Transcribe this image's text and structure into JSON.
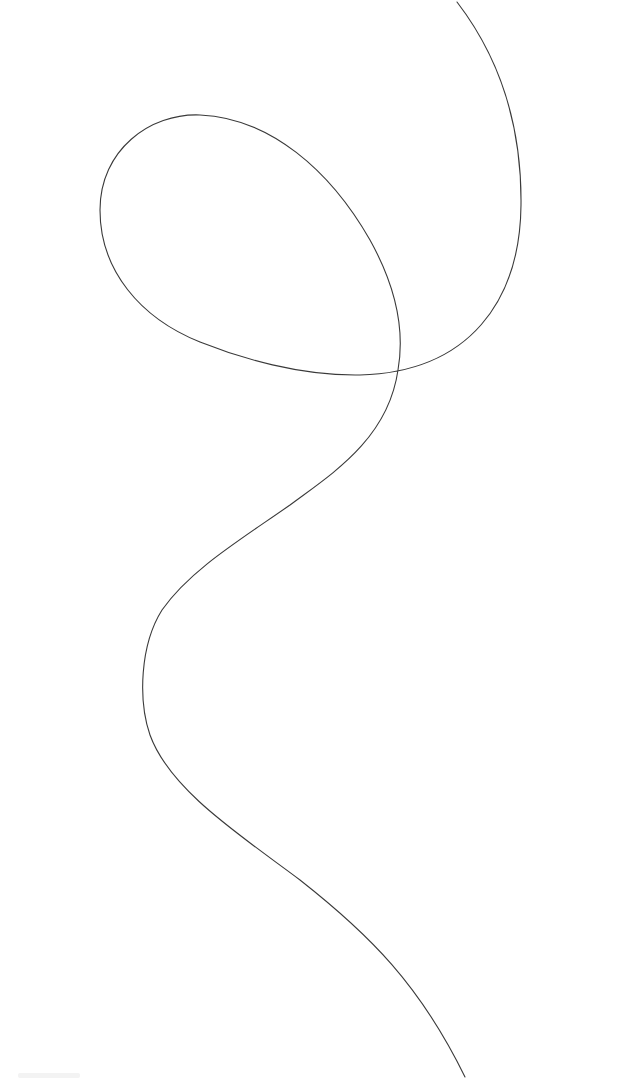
{
  "canvas": {
    "width": 632,
    "height": 1080,
    "background": "#ffffff"
  },
  "drawing": {
    "stroke_color": "#3a3a3a",
    "stroke_width": 1.1,
    "path": "M 457 2 C 490 45, 522 110, 521 205 C 520 300, 470 372, 360 375 C 300 376, 240 358, 200 342 C 140 318, 100 270, 100 210 C 100 150, 150 113, 200 115 C 270 118, 330 170, 370 240 C 395 285, 405 330, 398 370 C 388 440, 330 475, 290 505 C 240 540, 190 570, 162 610 C 140 645, 138 700, 150 735 C 170 790, 240 835, 300 880 C 370 935, 420 985, 465 1077"
  },
  "chart_data": null
}
